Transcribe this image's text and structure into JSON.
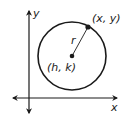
{
  "diagram": {
    "type": "circle-on-coordinate-plane",
    "axes": {
      "x_label": "x",
      "y_label": "y"
    },
    "circle": {
      "center_label": "(h, k)",
      "radius_label": "r",
      "point_label": "(x, y)"
    },
    "colors": {
      "stroke": "#1a1a1a",
      "background": "#ffffff"
    }
  }
}
